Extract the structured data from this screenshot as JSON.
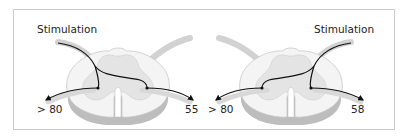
{
  "figure": {
    "panels": [
      {
        "id": "left",
        "stimulation_label": "Stimulation",
        "stimulation_side": "left",
        "left_output_value": "> 80",
        "right_output_value": "55"
      },
      {
        "id": "right",
        "stimulation_label": "Stimulation",
        "stimulation_side": "right",
        "left_output_value": "> 80",
        "right_output_value": "58"
      }
    ],
    "colors": {
      "frame": "#c9c9c9",
      "white_matter": "#f2f2f2",
      "gray_matter": "#e2e2e2",
      "root": "#d4d4d4",
      "shadow": "#bdbdbd",
      "pathway": "#111111"
    }
  }
}
